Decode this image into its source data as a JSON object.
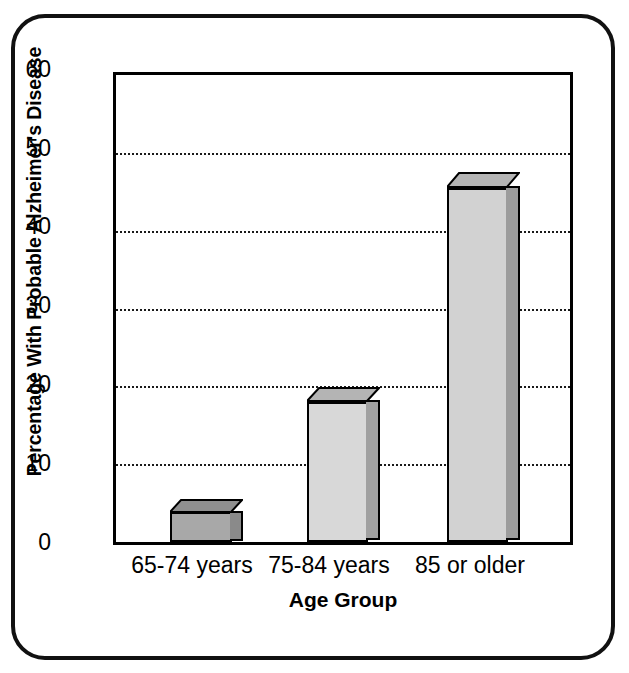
{
  "chart_data": {
    "type": "bar",
    "title": "",
    "xlabel": "Age Group",
    "ylabel": "Percentage With Probable Alzheimer's Disease",
    "categories": [
      "65-74 years",
      "75-84 years",
      "85 or older"
    ],
    "values": [
      3.8,
      18,
      45.5
    ],
    "series": [
      {
        "name": "Percentage With Probable Alzheimer's Disease",
        "values": [
          3.8,
          18,
          45.5
        ]
      }
    ],
    "ylim": [
      0,
      60
    ],
    "yticks": [
      0,
      10,
      20,
      30,
      40,
      50,
      60
    ],
    "ytick_labels": [
      "0",
      "10",
      "20",
      "30",
      "40",
      "50",
      "60"
    ],
    "grid": "horizontal-dotted",
    "gridlines_at": [
      10,
      20,
      30,
      40,
      50
    ],
    "legend": "none",
    "bar_style": "3d-extruded",
    "colors": {
      "bar1_front": "#a8a8a8",
      "bar1_top": "#8f8f8f",
      "bar1_side": "#8a8a8a",
      "bar2_front": "#d8d8d8",
      "bar2_top": "#b4b4b4",
      "bar2_side": "#a0a0a0",
      "bar3_front": "#d2d2d2",
      "bar3_top": "#b4b4b4",
      "bar3_side": "#9c9c9c",
      "axis": "#000000",
      "gridline": "#1a1a1a",
      "frame": "#111111",
      "background": "#ffffff"
    }
  },
  "axes": {
    "y_title": "Percentage With Probable Alzheimer's Disease",
    "x_title": "Age Group",
    "y_labels": {
      "t60": "60",
      "t50": "50",
      "t40": "40",
      "t30": "30",
      "t20": "20",
      "t10": "10",
      "t0": "0"
    },
    "x_labels": {
      "c0": "65-74 years",
      "c1": "75-84 years",
      "c2": "85 or older"
    }
  }
}
